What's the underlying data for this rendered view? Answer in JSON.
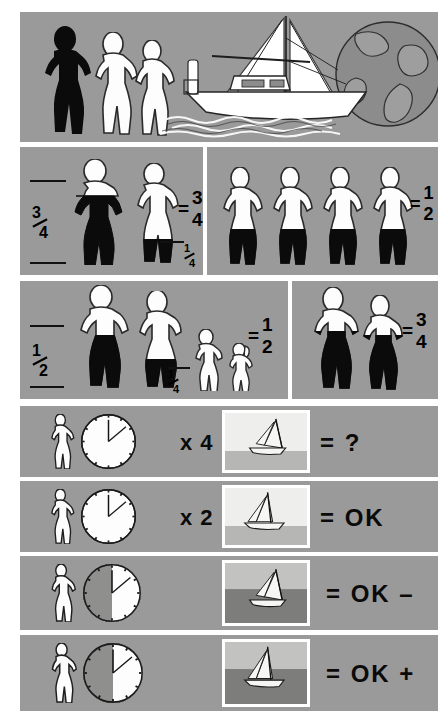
{
  "document": {
    "title": "Crew weight and sailing performance chart",
    "background_color": "#ffffff",
    "panel_color": "#999a99"
  },
  "panels": {
    "header": {
      "name": "header-illustration",
      "caption": "Three crew figures beside a sailboat and globe"
    },
    "row2_left": {
      "left_label": "3/4",
      "left_label_num": "3",
      "left_label_den": "4",
      "result_num": "3",
      "result_den": "4",
      "result_prefix": "=",
      "small_label_num": "1",
      "small_label_den": "4",
      "figures": [
        "black-figure-tall",
        "white-figure-quarter-black-legs"
      ]
    },
    "row2_right": {
      "result_prefix": "=",
      "result_num": "1",
      "result_den": "2",
      "figure_count": 4,
      "figure_style": "white-figure-half-black-legs"
    },
    "row3_left": {
      "left_label_num": "1",
      "left_label_den": "2",
      "small_label_num": "1",
      "small_label_den": "4",
      "result_prefix": "=",
      "result_num": "1",
      "result_den": "2",
      "figures": [
        "adult-male-black-legs",
        "adult-female-black-legs",
        "child-white",
        "small-child-white"
      ]
    },
    "row3_right": {
      "result_prefix": "=",
      "result_num": "3",
      "result_den": "4",
      "figures": [
        "adult-black-legs",
        "adult-black-legs"
      ]
    }
  },
  "comparison_rows": [
    {
      "id": "row-x4",
      "figure": "single-white-figure",
      "clock": {
        "hour_angle": 0,
        "minute_angle": 50,
        "shaded": false,
        "shade_side": "none"
      },
      "multiplier": "x 4",
      "photo": "sailboat-heeling-light",
      "result_prefix": "=",
      "result": "?"
    },
    {
      "id": "row-x2",
      "figure": "single-white-figure",
      "clock": {
        "hour_angle": 0,
        "minute_angle": 50,
        "shaded": false,
        "shade_side": "none"
      },
      "multiplier": "x 2",
      "photo": "sailboat-upright-light",
      "result_prefix": "=",
      "result": "OK"
    },
    {
      "id": "row-ok-minus",
      "figure": "single-white-figure",
      "clock": {
        "hour_angle": 0,
        "minute_angle": 50,
        "shaded": true,
        "shade_side": "right"
      },
      "multiplier": "",
      "photo": "sailboat-heeling-dark-sea",
      "result_prefix": "=",
      "result": "OK –"
    },
    {
      "id": "row-ok-plus",
      "figure": "single-white-figure",
      "clock": {
        "hour_angle": 0,
        "minute_angle": 50,
        "shaded": true,
        "shade_side": "right"
      },
      "multiplier": "",
      "photo": "sailboat-upright-dark-sea",
      "result_prefix": "=",
      "result": "OK +"
    }
  ]
}
